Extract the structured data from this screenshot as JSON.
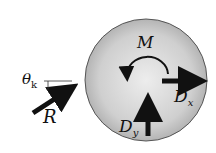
{
  "diagram": {
    "type": "free-body-diagram",
    "body": {
      "shape": "disk",
      "fill_center": "#e6e6e6",
      "fill_edge": "#a9a9a9",
      "outline": "#555555"
    },
    "labels": {
      "moment": "M",
      "dx_main": "D",
      "dx_sub": "x",
      "dy_main": "D",
      "dy_sub": "y",
      "r": "R",
      "theta_main": "θ",
      "theta_sub": "k"
    },
    "forces": [
      {
        "name": "R",
        "direction": "up-right into disk"
      },
      {
        "name": "Dx",
        "direction": "right"
      },
      {
        "name": "Dy",
        "direction": "up"
      },
      {
        "name": "M",
        "direction": "counterclockwise"
      }
    ]
  }
}
